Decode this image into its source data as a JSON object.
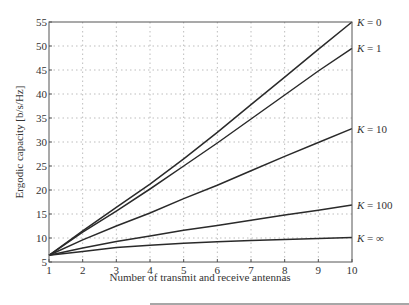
{
  "chart_data": {
    "type": "line",
    "title": "",
    "xlabel": "Number of transmit and receive antennas",
    "ylabel": "Ergodic capacity [b/s/Hz]",
    "x": [
      1,
      2,
      3,
      4,
      5,
      6,
      7,
      8,
      9,
      10
    ],
    "xlim": [
      1,
      10
    ],
    "ylim": [
      5,
      55
    ],
    "xticks": [
      "1",
      "2",
      "3",
      "4",
      "5",
      "6",
      "7",
      "8",
      "9",
      "10"
    ],
    "yticks": [
      "5",
      "10",
      "15",
      "20",
      "25",
      "30",
      "35",
      "40",
      "45",
      "50",
      "55"
    ],
    "grid": true,
    "legend_position": "right-inline labels",
    "series": [
      {
        "name": "K = 0",
        "label_k": "K",
        "label_v": " = 0",
        "values": [
          6.4,
          11.5,
          16.4,
          21.2,
          26.5,
          32.0,
          37.8,
          43.5,
          49.3,
          55.0
        ]
      },
      {
        "name": "K = 1",
        "label_k": "K",
        "label_v": " = 1",
        "values": [
          6.4,
          11.2,
          15.6,
          20.2,
          25.0,
          29.8,
          34.8,
          39.8,
          44.8,
          49.5
        ]
      },
      {
        "name": "K = 10",
        "label_k": "K",
        "label_v": " = 10",
        "values": [
          6.4,
          9.6,
          12.5,
          15.2,
          18.2,
          21.0,
          24.0,
          27.0,
          29.9,
          32.8
        ]
      },
      {
        "name": "K = 100",
        "label_k": "K",
        "label_v": " = 100",
        "values": [
          6.4,
          7.9,
          9.3,
          10.4,
          11.6,
          12.6,
          13.7,
          14.8,
          15.8,
          16.9
        ]
      },
      {
        "name": "K = ∞",
        "label_k": "K",
        "label_v": " = ∞",
        "values": [
          6.4,
          7.2,
          8.0,
          8.5,
          8.9,
          9.2,
          9.5,
          9.7,
          9.9,
          10.1
        ]
      }
    ],
    "colors": {
      "line": "#2a2a2a",
      "grid": "#bdbdbd",
      "frame": "#555555",
      "text": "#333333"
    }
  }
}
